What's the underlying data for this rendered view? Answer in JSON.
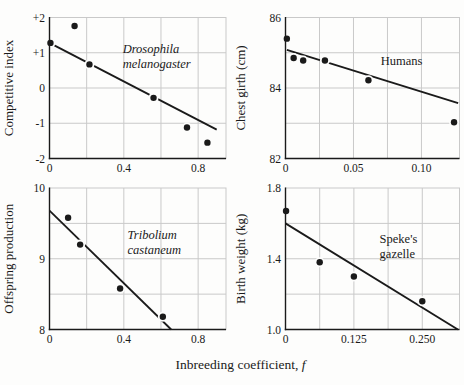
{
  "figure": {
    "x_axis_label": "Inbreeding coefficient, ",
    "x_axis_label_var": "f",
    "colors": {
      "ink": "#1a1a1a",
      "grid": "#c9c9c9",
      "background": "#fdfdfc"
    }
  },
  "chart_data": [
    {
      "type": "scatter",
      "name": "drosophila-melanogaster",
      "ylabel": "Competitive index",
      "annotation": [
        "Drosophila",
        "melanogaster"
      ],
      "annotation_italic": true,
      "annotation_pos": [
        0.394,
        0.92
      ],
      "x_range": [
        0,
        0.95
      ],
      "y_range": [
        -2,
        2
      ],
      "x_gridlines": [
        0.2,
        0.4,
        0.6,
        0.8
      ],
      "y_gridlines": [
        -1,
        0,
        1
      ],
      "x_ticks": [
        {
          "v": 0,
          "t": "0"
        },
        {
          "v": 0.4,
          "t": "0.4"
        },
        {
          "v": 0.8,
          "t": "0.8"
        }
      ],
      "y_ticks": [
        {
          "v": 2,
          "t": "+2"
        },
        {
          "v": 1,
          "t": "+1"
        },
        {
          "v": 0,
          "t": "0"
        },
        {
          "v": -1,
          "t": "-1"
        },
        {
          "v": -2,
          "t": "-2"
        }
      ],
      "points": [
        [
          0.005,
          1.28
        ],
        [
          0.135,
          1.76
        ],
        [
          0.215,
          0.67
        ],
        [
          0.56,
          -0.28
        ],
        [
          0.74,
          -1.12
        ],
        [
          0.85,
          -1.55
        ]
      ],
      "trend_line": [
        [
          0.0,
          1.28
        ],
        [
          0.9,
          -1.18
        ]
      ]
    },
    {
      "type": "scatter",
      "name": "humans",
      "ylabel": "Chest girth (cm)",
      "annotation": [
        "Humans"
      ],
      "annotation_italic": false,
      "annotation_pos": [
        0.07,
        84.78
      ],
      "x_range": [
        0,
        0.128
      ],
      "y_range": [
        82,
        86
      ],
      "x_gridlines": [
        0.025,
        0.05,
        0.075,
        0.1
      ],
      "y_gridlines": [
        83,
        84,
        85
      ],
      "x_ticks": [
        {
          "v": 0,
          "t": "0"
        },
        {
          "v": 0.05,
          "t": "0.05"
        },
        {
          "v": 0.1,
          "t": "0.10"
        }
      ],
      "y_ticks": [
        {
          "v": 86,
          "t": "86"
        },
        {
          "v": 84,
          "t": "84"
        },
        {
          "v": 82,
          "t": "82"
        }
      ],
      "points": [
        [
          0.001,
          85.4
        ],
        [
          0.006,
          84.85
        ],
        [
          0.013,
          84.78
        ],
        [
          0.029,
          84.78
        ],
        [
          0.061,
          84.22
        ],
        [
          0.124,
          83.03
        ]
      ],
      "trend_line": [
        [
          0.001,
          85.08
        ],
        [
          0.127,
          83.57
        ]
      ]
    },
    {
      "type": "scatter",
      "name": "tribolium-castaneum",
      "ylabel": "Offspring production",
      "annotation": [
        "Tribolium",
        "castaneum"
      ],
      "annotation_italic": true,
      "annotation_pos": [
        0.42,
        9.24
      ],
      "x_range": [
        0,
        0.95
      ],
      "y_range": [
        8,
        10
      ],
      "x_gridlines": [
        0.2,
        0.4,
        0.6,
        0.8
      ],
      "y_gridlines": [
        8.5,
        9,
        9.5
      ],
      "x_ticks": [
        {
          "v": 0,
          "t": "0"
        },
        {
          "v": 0.4,
          "t": "0.4"
        },
        {
          "v": 0.8,
          "t": "0.8"
        }
      ],
      "y_ticks": [
        {
          "v": 10,
          "t": "10"
        },
        {
          "v": 9,
          "t": "9"
        },
        {
          "v": 8,
          "t": "8"
        }
      ],
      "points": [
        [
          0.1,
          9.58
        ],
        [
          0.165,
          9.2
        ],
        [
          0.38,
          8.58
        ],
        [
          0.61,
          8.18
        ]
      ],
      "trend_line": [
        [
          0.0,
          9.68
        ],
        [
          0.655,
          8.0
        ]
      ]
    },
    {
      "type": "scatter",
      "name": "spekes-gazelle",
      "ylabel": "Birth weight (kg)",
      "annotation": [
        "Speke's",
        "gazelle"
      ],
      "annotation_italic": false,
      "annotation_pos": [
        0.172,
        1.47
      ],
      "x_range": [
        0,
        0.318
      ],
      "y_range": [
        1.0,
        1.8
      ],
      "x_gridlines": [
        0.0625,
        0.125,
        0.1875,
        0.25
      ],
      "y_gridlines": [
        1.2,
        1.4,
        1.6
      ],
      "x_ticks": [
        {
          "v": 0,
          "t": "0"
        },
        {
          "v": 0.125,
          "t": "0.125"
        },
        {
          "v": 0.25,
          "t": "0.250"
        }
      ],
      "y_ticks": [
        {
          "v": 1.8,
          "t": "1.8"
        },
        {
          "v": 1.4,
          "t": "1.4"
        },
        {
          "v": 1.0,
          "t": "1.0"
        }
      ],
      "points": [
        [
          0.001,
          1.67
        ],
        [
          0.0625,
          1.38
        ],
        [
          0.125,
          1.3
        ],
        [
          0.25,
          1.16
        ]
      ],
      "trend_line": [
        [
          0.0,
          1.6
        ],
        [
          0.315,
          1.0
        ]
      ]
    }
  ]
}
